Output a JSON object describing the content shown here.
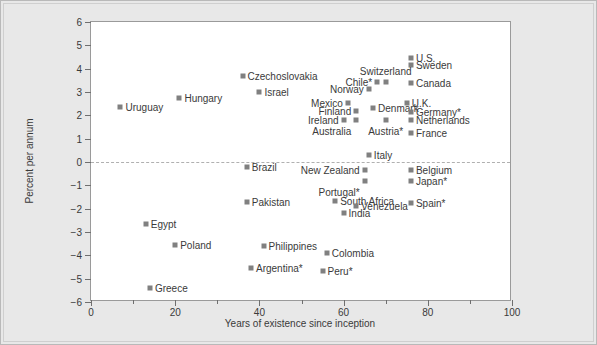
{
  "chart_data": {
    "type": "scatter",
    "title": "",
    "xlabel": "Years of existence since inception",
    "ylabel": "Percent per annum",
    "xlim": [
      0,
      100
    ],
    "ylim": [
      -6,
      6
    ],
    "xticks": [
      0,
      20,
      40,
      60,
      80,
      100
    ],
    "xticks_minor": [
      10,
      30,
      50,
      70,
      90
    ],
    "yticks": [
      -6,
      -5,
      -4,
      -3,
      -2,
      -1,
      0,
      1,
      2,
      3,
      4,
      5,
      6
    ],
    "grid": false,
    "zero_reference_line": 0,
    "legend": "none",
    "marker_color": "#808080",
    "background_color": "#e8e8e8",
    "plot_background_color": "#ffffff",
    "points": [
      {
        "label": "Uruguay",
        "x": 7,
        "y": 2.35,
        "side": "r"
      },
      {
        "label": "Hungary",
        "x": 21,
        "y": 2.75,
        "side": "r"
      },
      {
        "label": "Czechoslovakia",
        "x": 36,
        "y": 3.7,
        "side": "r"
      },
      {
        "label": "Israel",
        "x": 40,
        "y": 3.0,
        "side": "r"
      },
      {
        "label": "Brazil",
        "x": 37,
        "y": -0.2,
        "side": "r"
      },
      {
        "label": "U.S.",
        "x": 76,
        "y": 4.45,
        "side": "r"
      },
      {
        "label": "Sweden",
        "x": 76,
        "y": 4.15,
        "side": "r"
      },
      {
        "label": "Switzerland",
        "x": 70,
        "y": 3.45,
        "side": "c-above"
      },
      {
        "label": "Canada",
        "x": 76,
        "y": 3.4,
        "side": "r"
      },
      {
        "label": "Chile*",
        "x": 68,
        "y": 3.45,
        "side": "l"
      },
      {
        "label": "Norway",
        "x": 66,
        "y": 3.15,
        "side": "l"
      },
      {
        "label": "Mexico",
        "x": 61,
        "y": 2.55,
        "side": "l"
      },
      {
        "label": "U.K.",
        "x": 75,
        "y": 2.55,
        "side": "r"
      },
      {
        "label": "Denmark",
        "x": 67,
        "y": 2.3,
        "side": "r"
      },
      {
        "label": "Finland",
        "x": 63,
        "y": 2.2,
        "side": "l"
      },
      {
        "label": "Germany*",
        "x": 76,
        "y": 2.15,
        "side": "r"
      },
      {
        "label": "Ireland",
        "x": 60,
        "y": 1.8,
        "side": "l"
      },
      {
        "label": "Austria*",
        "x": 70,
        "y": 1.8,
        "side": "c-below"
      },
      {
        "label": "Netherlands",
        "x": 76,
        "y": 1.8,
        "side": "r"
      },
      {
        "label": "Australia",
        "x": 63,
        "y": 1.8,
        "side": "l-below"
      },
      {
        "label": "France",
        "x": 76,
        "y": 1.25,
        "side": "r"
      },
      {
        "label": "Italy",
        "x": 66,
        "y": 0.3,
        "side": "r"
      },
      {
        "label": "New Zealand",
        "x": 65,
        "y": -0.35,
        "side": "l"
      },
      {
        "label": "Belgium",
        "x": 76,
        "y": -0.35,
        "side": "r"
      },
      {
        "label": "Japan*",
        "x": 76,
        "y": -0.8,
        "side": "r"
      },
      {
        "label": "Portugal*",
        "x": 65,
        "y": -0.8,
        "side": "l-below"
      },
      {
        "label": "Pakistan",
        "x": 37,
        "y": -1.7,
        "side": "r"
      },
      {
        "label": "South Africa",
        "x": 58,
        "y": -1.65,
        "side": "r"
      },
      {
        "label": "Venezuela",
        "x": 63,
        "y": -1.9,
        "side": "r"
      },
      {
        "label": "Spain*",
        "x": 76,
        "y": -1.75,
        "side": "r"
      },
      {
        "label": "India",
        "x": 60,
        "y": -2.2,
        "side": "r"
      },
      {
        "label": "Egypt",
        "x": 13,
        "y": -2.65,
        "side": "r"
      },
      {
        "label": "Poland",
        "x": 20,
        "y": -3.55,
        "side": "r"
      },
      {
        "label": "Philippines",
        "x": 41,
        "y": -3.6,
        "side": "r"
      },
      {
        "label": "Colombia",
        "x": 56,
        "y": -3.9,
        "side": "r"
      },
      {
        "label": "Argentina*",
        "x": 38,
        "y": -4.55,
        "side": "r"
      },
      {
        "label": "Peru*",
        "x": 55,
        "y": -4.65,
        "side": "r"
      },
      {
        "label": "Greece",
        "x": 14,
        "y": -5.4,
        "side": "r"
      }
    ]
  }
}
